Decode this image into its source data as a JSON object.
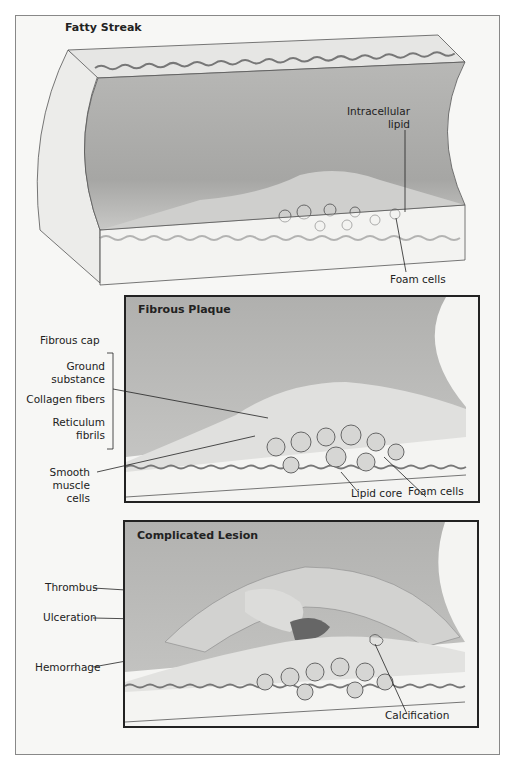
{
  "figure": {
    "stages": [
      {
        "title": "Fatty Streak",
        "labels": [
          "Intracellular lipid",
          "Foam cells"
        ]
      },
      {
        "title": "Fibrous Plaque",
        "labels": {
          "fibrous_cap": "Fibrous cap",
          "ground_substance_1": "Ground",
          "ground_substance_2": "substance",
          "collagen": "Collagen fibers",
          "reticulum_1": "Reticulum",
          "reticulum_2": "fibrils",
          "smooth_1": "Smooth",
          "smooth_2": "muscle",
          "smooth_3": "cells",
          "lipid_core": "Lipid core",
          "foam_cells": "Foam cells"
        }
      },
      {
        "title": "Complicated Lesion",
        "labels": {
          "thrombus": "Thrombus",
          "ulceration": "Ulceration",
          "hemorrhage": "Hemorrhage",
          "calcification": "Calcification"
        }
      }
    ],
    "fatty_streak_labels": {
      "intracellular_1": "Intracellular",
      "intracellular_2": "lipid",
      "foam_cells": "Foam cells"
    }
  }
}
